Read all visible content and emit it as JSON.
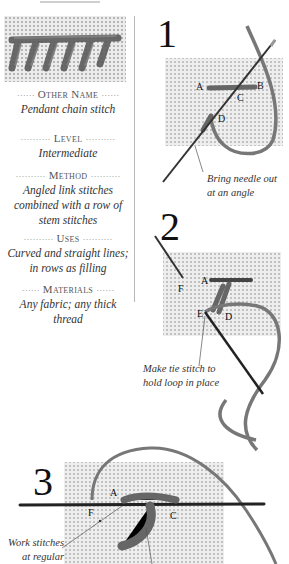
{
  "sidebar": {
    "sections": [
      {
        "heading": "Other Name",
        "body": [
          "Pendant chain stitch"
        ]
      },
      {
        "heading": "Level",
        "body": [
          "Intermediate"
        ]
      },
      {
        "heading": "Method",
        "body": [
          "Angled link stitches",
          "combined with a row of",
          "stem stitches"
        ]
      },
      {
        "heading": "Uses",
        "body": [
          "Curved and straight lines;",
          "in rows as filling"
        ]
      },
      {
        "heading": "Materials",
        "body": [
          "Any fabric; any thick",
          "thread"
        ]
      }
    ],
    "dots_short": "······",
    "dots_long": "··········"
  },
  "steps": [
    {
      "number": "1",
      "labels": [
        "A",
        "B",
        "C",
        "D"
      ],
      "caption": [
        "Bring needle out",
        "at an angle"
      ]
    },
    {
      "number": "2",
      "labels": [
        "A",
        "F",
        "E",
        "D"
      ],
      "caption": [
        "Make tie stitch to",
        "hold loop in place"
      ]
    },
    {
      "number": "3",
      "labels": [
        "A",
        "F",
        "C"
      ],
      "caption": [
        "Work stitches",
        "at regular"
      ]
    }
  ],
  "colors": {
    "fabric": "#e9e9e9",
    "fabric_hole": "#bdbdbd",
    "thread": "#6f6f6f",
    "needle": "#2a2a2a",
    "border": "#b8b8b8"
  }
}
